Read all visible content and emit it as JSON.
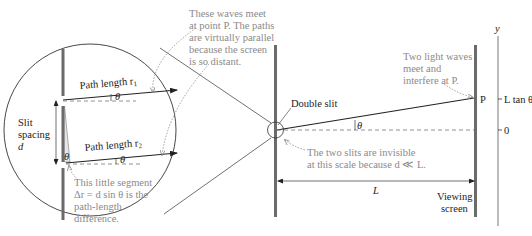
{
  "figure": {
    "type": "double-slit-interference-geometry",
    "labels": {
      "path_r1": "Path length r",
      "path_r1_sub": "1",
      "path_r2": "Path length r",
      "path_r2_sub": "2",
      "theta": "θ",
      "slit_spacing_line1": "Slit",
      "slit_spacing_line2": "spacing",
      "slit_spacing_symbol": "d",
      "double_slit": "Double slit",
      "point_p": "P",
      "distance_L": "L",
      "viewing_screen_line1": "Viewing",
      "viewing_screen_line2": "screen",
      "axis_y": "y",
      "axis_tick_top": "L tan θ",
      "axis_tick_zero": "0"
    },
    "notes": {
      "parallel_paths": [
        "These waves meet",
        "at point P. The paths",
        "are virtually parallel",
        "because the screen",
        "is so distant."
      ],
      "segment": [
        "This little segment",
        "Δr = d sin θ is the",
        "path-length",
        "difference."
      ],
      "light_waves": [
        "Two light waves",
        "meet and",
        "interfere at P."
      ],
      "invisible_slits": [
        "The two slits are invisible",
        "at this scale because d ≪ L."
      ]
    },
    "colors": {
      "line": "#222222",
      "wall": "#6b6b6b",
      "note_text": "#8a8a8a",
      "dashed": "#777777"
    }
  }
}
